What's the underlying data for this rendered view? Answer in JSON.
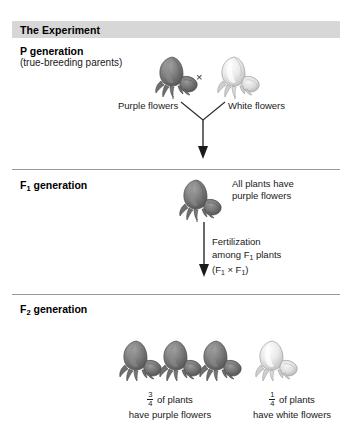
{
  "figure": {
    "top_partial_text": "",
    "band_title": "The Experiment"
  },
  "p_generation": {
    "label": "P generation",
    "sublabel": "(true-breeding parents)",
    "cross_symbol": "×",
    "parent_left": {
      "caption": "Purple flowers",
      "color_name": "purple",
      "fill": "#7a7a7a"
    },
    "parent_right": {
      "caption": "White flowers",
      "color_name": "white",
      "fill": "#e8e8e8"
    }
  },
  "f1_generation": {
    "label_main": "F",
    "label_sub": "1",
    "label_tail": " generation",
    "note_line1": "All plants have",
    "note_line2": "purple flowers",
    "offspring": {
      "color_name": "purple",
      "fill": "#7a7a7a"
    }
  },
  "fertilization": {
    "line1": "Fertilization",
    "line2_pre": "among F",
    "line2_sub": "1",
    "line2_post": " plants",
    "line3_open": "(F",
    "line3_sub1": "1",
    "line3_times": " × F",
    "line3_sub2": "1",
    "line3_close": ")"
  },
  "f2_generation": {
    "label_main": "F",
    "label_sub": "2",
    "label_tail": " generation",
    "purple_group": {
      "count": 3,
      "fraction_num": "3",
      "fraction_den": "4",
      "text_line1": " of plants",
      "text_line2": "have purple flowers",
      "fill": "#7a7a7a"
    },
    "white_group": {
      "count": 1,
      "fraction_num": "1",
      "fraction_den": "4",
      "text_line1": " of plants",
      "text_line2": "have white flowers",
      "fill": "#e8e8e8"
    }
  },
  "colors": {
    "band_bg": "#d7d7d7",
    "rule": "#9a9a9a",
    "text": "#1a1a1a",
    "arrow": "#2b2b2b"
  }
}
